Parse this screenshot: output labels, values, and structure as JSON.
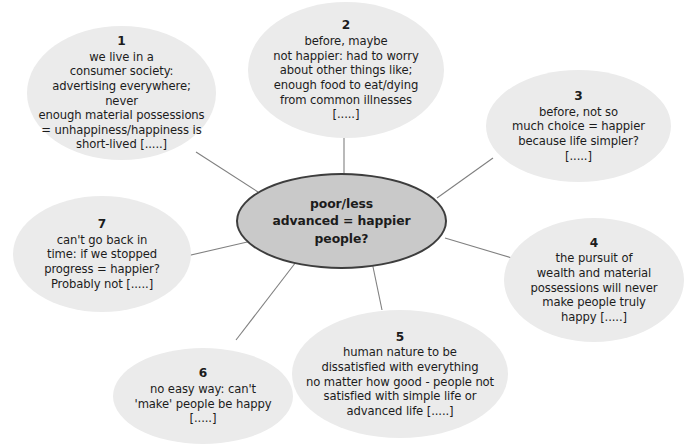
{
  "diagram": {
    "type": "mind-map",
    "title": "poor/less advanced = happier people?",
    "background_color": "#ffffff",
    "center": {
      "text": "poor/less\nadvanced = happier\npeople?",
      "fill_color": "#c9c9c9",
      "border_color": "#3d3d3d"
    },
    "branch_fill_color": "#ebebeb",
    "connector_color": "#808080",
    "branches": [
      {
        "number": "1",
        "text": "we live in a\nconsumer society:\nadvertising everywhere; never\nenough material possessions\n= unhappiness/happiness is\nshort-lived [.....]"
      },
      {
        "number": "2",
        "text": "before, maybe\nnot happier: had to worry\nabout other things like;\nenough food to eat/dying\nfrom common illnesses\n[.....]"
      },
      {
        "number": "3",
        "text": "before, not so\nmuch choice = happier\nbecause life simpler?\n[.....]"
      },
      {
        "number": "4",
        "text": "the pursuit of\nwealth and material\npossessions will never\nmake people truly\nhappy [.....]"
      },
      {
        "number": "5",
        "text": "human nature to be\ndissatisfied with everything\nno matter how good - people not\nsatisfied with simple life or\nadvanced life [.....]"
      },
      {
        "number": "6",
        "text": "no easy way: can't\n'make' people be happy\n[.....]"
      },
      {
        "number": "7",
        "text": "can't go back in\ntime: if we stopped\nprogress = happier?\nProbably not [.....]"
      }
    ]
  }
}
